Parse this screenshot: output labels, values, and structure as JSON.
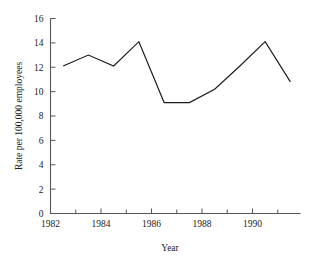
{
  "chart_data": {
    "type": "line",
    "title": "",
    "xlabel": "Year",
    "ylabel": "Rate per 100,000 employees",
    "xlim": [
      1982,
      1991.9
    ],
    "ylim": [
      0,
      16
    ],
    "grid": false,
    "legend": null,
    "x_major_ticks": [
      1982,
      1984,
      1986,
      1988,
      1990
    ],
    "x_major_tick_labels": [
      "1982",
      "1984",
      "1986",
      "1988",
      "1990"
    ],
    "x_minor_ticks": [
      1983,
      1985,
      1987,
      1989,
      1991
    ],
    "y_ticks": [
      0,
      2,
      4,
      6,
      8,
      10,
      12,
      14,
      16
    ],
    "y_tick_labels": [
      "0",
      "2",
      "4",
      "6",
      "8",
      "10",
      "12",
      "14",
      "16"
    ],
    "series": [
      {
        "name": "Rate",
        "color": "#1a1a1a",
        "x": [
          1982.5,
          1983.5,
          1984.5,
          1985.5,
          1986.5,
          1987.5,
          1988.5,
          1989.5,
          1990.5,
          1991.5
        ],
        "values": [
          12.1,
          13.0,
          12.1,
          14.1,
          9.1,
          9.1,
          10.2,
          12.1,
          14.1,
          10.8
        ]
      }
    ]
  },
  "axis": {
    "line_color": "#555555",
    "tick_color": "#555555"
  }
}
